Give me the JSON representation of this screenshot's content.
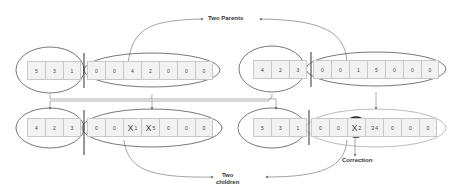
{
  "labels": {
    "parents": "Two Parents",
    "children_line1": "Two",
    "children_line2": "children",
    "correction": "Correction"
  },
  "colors": {
    "cell_fill": "#f2f2f2",
    "cell_border": "#c8c8c8",
    "ellipse_stroke": "#555555",
    "connector": "#8a8a8a",
    "divider": "#333333"
  },
  "chromosomes": {
    "parent1": {
      "head": [
        "5",
        "3",
        "1"
      ],
      "tail": [
        "0",
        "0",
        "4",
        "2",
        "0",
        "0",
        "0"
      ]
    },
    "parent2": {
      "head": [
        "4",
        "2",
        "3"
      ],
      "tail": [
        "0",
        "0",
        "1",
        "5",
        "0",
        "0",
        "0"
      ]
    },
    "child1": {
      "head": [
        "4",
        "2",
        "3"
      ],
      "tail": [
        {
          "value": "0"
        },
        {
          "value": "0"
        },
        {
          "struck": "X",
          "value": "1"
        },
        {
          "struck": "X",
          "value": "5"
        },
        {
          "value": "0"
        },
        {
          "value": "0"
        },
        {
          "value": "0"
        }
      ]
    },
    "child2": {
      "head": [
        "5",
        "3",
        "1"
      ],
      "tail": [
        {
          "value": "0"
        },
        {
          "value": "0"
        },
        {
          "struck": "X",
          "value": "2",
          "circled": true
        },
        {
          "struck": "3",
          "value": "4"
        },
        {
          "value": "0"
        },
        {
          "value": "0"
        },
        {
          "value": "0"
        }
      ]
    }
  }
}
